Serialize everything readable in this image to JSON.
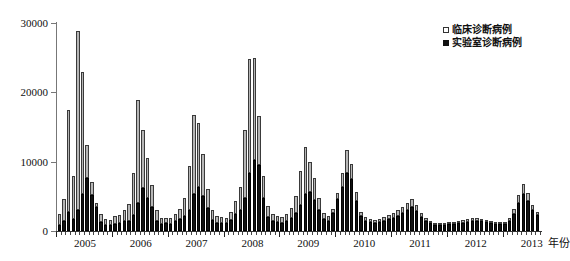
{
  "chart_data": {
    "type": "bar",
    "title": "",
    "xlabel": "年份",
    "ylabel": "报告病例数",
    "ylim": [
      0,
      30000
    ],
    "yticks": [
      0,
      10000,
      20000,
      30000
    ],
    "ytick_labels": [
      "0",
      "10000",
      "20000",
      "30000"
    ],
    "xtick_labels": [
      "2005",
      "2006",
      "2007",
      "2008",
      "2009",
      "2010",
      "2011",
      "2012",
      "2013"
    ],
    "grid": false,
    "legend_position": "top-right",
    "stacked": true,
    "x_unit_suffix": "年份",
    "series": [
      {
        "name": "实验室诊断病例",
        "color": "#111111",
        "values": [
          900,
          1500,
          2800,
          1800,
          3000,
          5300,
          7600,
          5200,
          3400,
          1300,
          900,
          900,
          1000,
          1100,
          1400,
          1500,
          2300,
          4000,
          6200,
          4800,
          3500,
          1500,
          1000,
          1100,
          1000,
          1400,
          1700,
          2200,
          3000,
          5300,
          6300,
          5000,
          3300,
          1600,
          1200,
          1200,
          1100,
          1600,
          2400,
          3000,
          4800,
          8300,
          10300,
          9500,
          4800,
          2000,
          1400,
          1300,
          1200,
          1500,
          1900,
          2600,
          3800,
          5400,
          5600,
          4500,
          3000,
          1700,
          1500,
          2600,
          4600,
          6400,
          8300,
          7500,
          4400,
          2100,
          1500,
          1300,
          1200,
          1300,
          1500,
          1700,
          1900,
          2200,
          2600,
          3100,
          3500,
          2900,
          2000,
          1400,
          1100,
          900,
          800,
          900,
          950,
          1000,
          1100,
          1200,
          1300,
          1400,
          1500,
          1400,
          1300,
          1100,
          1000,
          950,
          1000,
          1500,
          2500,
          4000,
          5300,
          4400,
          3100,
          2300
        ]
      },
      {
        "name": "临床诊断病例",
        "color": "#b6b6b6",
        "values": [
          1600,
          3100,
          14700,
          6200,
          25800,
          17700,
          4800,
          1900,
          700,
          1100,
          800,
          700,
          1100,
          1200,
          1700,
          2400,
          6100,
          14900,
          8300,
          5700,
          3200,
          1500,
          900,
          800,
          900,
          1100,
          1500,
          2600,
          6400,
          11500,
          9300,
          6100,
          2800,
          1400,
          900,
          800,
          800,
          1200,
          2000,
          3300,
          9700,
          16500,
          14700,
          7100,
          3200,
          1600,
          1100,
          900,
          800,
          1000,
          1400,
          2500,
          4800,
          6700,
          4400,
          3200,
          1700,
          900,
          700,
          600,
          900,
          1900,
          3400,
          2100,
          1300,
          700,
          500,
          400,
          400,
          400,
          500,
          600,
          700,
          800,
          900,
          1000,
          1100,
          800,
          600,
          450,
          350,
          300,
          250,
          300,
          300,
          350,
          400,
          450,
          500,
          500,
          450,
          400,
          350,
          300,
          280,
          280,
          300,
          450,
          700,
          1200,
          1500,
          1100,
          700,
          500
        ]
      }
    ]
  },
  "legend": {
    "items": [
      {
        "label": "临床诊断病例",
        "marker": "open-square"
      },
      {
        "label": "实验室诊断病例",
        "marker": "filled-square"
      }
    ]
  },
  "axes": {
    "y_title": "报告病例数",
    "x_title": "年份"
  }
}
